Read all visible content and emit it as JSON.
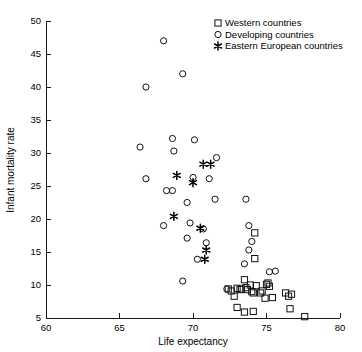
{
  "chart_data": {
    "type": "scatter",
    "title": "",
    "xlabel": "Life expectancy",
    "ylabel": "Infant mortality rate",
    "xlim": [
      60,
      80
    ],
    "ylim": [
      5,
      50
    ],
    "xticks": [
      60,
      65,
      70,
      75,
      80
    ],
    "yticks": [
      5,
      10,
      15,
      20,
      25,
      30,
      35,
      40,
      45,
      50
    ],
    "grid": false,
    "legend_position": "top-right",
    "legend": [
      {
        "label": "Western countries",
        "marker": "square"
      },
      {
        "label": "Developing countries",
        "marker": "circle"
      },
      {
        "label": "Eastern European countries",
        "marker": "star"
      }
    ],
    "series": [
      {
        "name": "Western countries",
        "marker": "square",
        "points": [
          [
            72.4,
            9.4
          ],
          [
            72.6,
            9.1
          ],
          [
            72.8,
            8.3
          ],
          [
            73.0,
            9.5
          ],
          [
            73.2,
            9.3
          ],
          [
            73.3,
            9.4
          ],
          [
            73.0,
            6.6
          ],
          [
            73.5,
            10.8
          ],
          [
            73.6,
            9.6
          ],
          [
            73.7,
            9.3
          ],
          [
            73.5,
            5.9
          ],
          [
            73.9,
            10.0
          ],
          [
            74.0,
            9.0
          ],
          [
            74.1,
            8.8
          ],
          [
            74.2,
            17.9
          ],
          [
            74.2,
            14.0
          ],
          [
            74.3,
            9.9
          ],
          [
            74.1,
            6.0
          ],
          [
            74.6,
            8.8
          ],
          [
            74.7,
            9.1
          ],
          [
            74.9,
            8.0
          ],
          [
            75.0,
            10.1
          ],
          [
            75.1,
            10.3
          ],
          [
            75.2,
            9.8
          ],
          [
            75.4,
            8.1
          ],
          [
            76.3,
            8.8
          ],
          [
            76.5,
            8.3
          ],
          [
            76.7,
            8.6
          ],
          [
            76.6,
            6.4
          ],
          [
            77.6,
            5.2
          ]
        ]
      },
      {
        "name": "Developing countries",
        "marker": "circle",
        "points": [
          [
            68.0,
            47.0
          ],
          [
            69.3,
            42.0
          ],
          [
            66.8,
            40.0
          ],
          [
            66.4,
            30.9
          ],
          [
            68.6,
            32.2
          ],
          [
            70.1,
            32.0
          ],
          [
            68.7,
            30.3
          ],
          [
            71.6,
            29.3
          ],
          [
            66.8,
            26.1
          ],
          [
            70.0,
            26.3
          ],
          [
            71.1,
            26.1
          ],
          [
            68.2,
            24.3
          ],
          [
            68.6,
            24.3
          ],
          [
            69.6,
            22.5
          ],
          [
            71.5,
            23.0
          ],
          [
            73.6,
            23.0
          ],
          [
            68.0,
            19.0
          ],
          [
            69.8,
            19.4
          ],
          [
            73.8,
            19.0
          ],
          [
            69.6,
            17.1
          ],
          [
            70.7,
            18.5
          ],
          [
            74.0,
            16.6
          ],
          [
            70.9,
            16.4
          ],
          [
            73.8,
            15.3
          ],
          [
            70.3,
            13.9
          ],
          [
            73.5,
            13.2
          ],
          [
            75.2,
            12.0
          ],
          [
            75.6,
            12.1
          ],
          [
            69.3,
            10.6
          ],
          [
            72.3,
            9.4
          ]
        ]
      },
      {
        "name": "Eastern European countries",
        "marker": "star",
        "points": [
          [
            70.7,
            28.3
          ],
          [
            71.2,
            28.3
          ],
          [
            68.9,
            26.6
          ],
          [
            70.0,
            25.5
          ],
          [
            68.7,
            20.4
          ],
          [
            70.5,
            18.6
          ],
          [
            70.9,
            15.3
          ],
          [
            70.8,
            13.9
          ]
        ]
      }
    ]
  }
}
